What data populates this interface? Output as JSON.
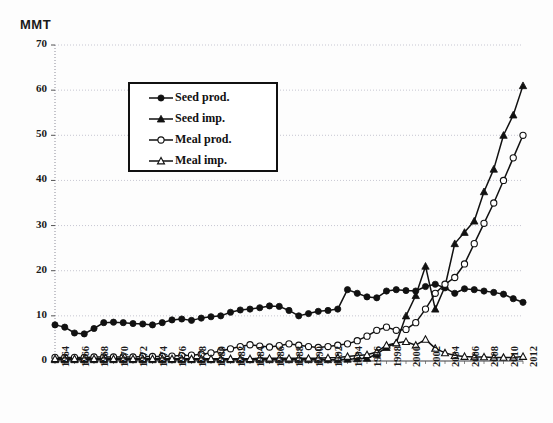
{
  "chart_data": {
    "type": "line",
    "title": "",
    "ylabel": "MMT",
    "xlabel": "",
    "ylim": [
      0,
      70
    ],
    "yticks": [
      0,
      10,
      20,
      30,
      40,
      50,
      60,
      70
    ],
    "grid": true,
    "legend_position": "upper-left-inside",
    "x": [
      1964,
      1965,
      1966,
      1967,
      1968,
      1969,
      1970,
      1971,
      1972,
      1973,
      1974,
      1975,
      1976,
      1977,
      1978,
      1979,
      1980,
      1981,
      1982,
      1983,
      1984,
      1985,
      1986,
      1987,
      1988,
      1989,
      1990,
      1991,
      1992,
      1993,
      1994,
      1995,
      1996,
      1997,
      1998,
      1999,
      2000,
      2001,
      2002,
      2003,
      2004,
      2005,
      2006,
      2007,
      2008,
      2009,
      2010,
      2011,
      2012
    ],
    "xtick_labels": [
      "1964",
      "1966",
      "1968",
      "1970",
      "1972",
      "1974",
      "1976",
      "1978",
      "1980",
      "1982",
      "1984",
      "1986",
      "1988",
      "1990",
      "1992",
      "1994",
      "1996",
      "1998",
      "2000",
      "2002",
      "2004",
      "2006",
      "2008",
      "2010",
      "2012"
    ],
    "series": [
      {
        "name": "Seed prod.",
        "marker": "filled-circle",
        "values": [
          8.0,
          7.5,
          6.2,
          6.0,
          7.2,
          8.5,
          8.6,
          8.5,
          8.3,
          8.2,
          8.0,
          8.5,
          9.1,
          9.3,
          9.0,
          9.5,
          9.8,
          10.0,
          10.8,
          11.3,
          11.5,
          11.8,
          12.2,
          12.1,
          11.2,
          10.0,
          10.5,
          11.0,
          11.2,
          11.5,
          15.8,
          15.0,
          14.2,
          14.0,
          15.5,
          15.8,
          15.6,
          15.5,
          16.5,
          17.0,
          16.2,
          15.0,
          16.0,
          15.8,
          15.5,
          15.2,
          14.8,
          13.8,
          13.0
        ]
      },
      {
        "name": "Seed imp.",
        "marker": "filled-triangle",
        "values": [
          0.3,
          0.3,
          0.3,
          0.3,
          0.3,
          0.3,
          0.3,
          0.3,
          0.3,
          0.3,
          0.3,
          0.3,
          0.3,
          0.3,
          0.3,
          0.3,
          0.3,
          0.3,
          0.3,
          0.3,
          0.3,
          0.3,
          0.3,
          0.3,
          0.3,
          0.3,
          0.3,
          0.3,
          0.3,
          0.3,
          0.4,
          0.5,
          0.6,
          1.5,
          3.0,
          4.0,
          10.0,
          14.5,
          21.0,
          11.5,
          16.5,
          26.0,
          28.5,
          31.0,
          37.5,
          42.5,
          50.0,
          54.5,
          61.0
        ]
      },
      {
        "name": "Meal prod.",
        "marker": "open-circle",
        "values": [
          0.8,
          0.8,
          0.8,
          0.8,
          0.9,
          0.9,
          0.9,
          0.9,
          0.9,
          1.0,
          1.0,
          1.0,
          1.1,
          1.2,
          1.3,
          1.5,
          1.8,
          2.2,
          2.7,
          3.2,
          3.6,
          3.3,
          3.1,
          3.4,
          3.8,
          3.5,
          3.2,
          3.0,
          3.2,
          3.5,
          3.8,
          4.5,
          5.5,
          6.8,
          7.5,
          6.8,
          7.0,
          8.5,
          11.5,
          15.0,
          17.0,
          18.5,
          21.5,
          26.0,
          30.5,
          35.0,
          40.0,
          45.0,
          50.0
        ]
      },
      {
        "name": "Meal imp.",
        "marker": "open-triangle",
        "values": [
          0.5,
          0.5,
          0.5,
          0.5,
          0.5,
          0.5,
          0.5,
          0.5,
          0.5,
          0.5,
          0.5,
          0.5,
          0.5,
          0.5,
          0.5,
          0.5,
          0.5,
          0.5,
          0.5,
          0.5,
          0.5,
          0.6,
          0.6,
          0.6,
          0.6,
          0.6,
          0.6,
          0.6,
          0.7,
          0.8,
          1.0,
          1.2,
          1.4,
          2.0,
          3.5,
          4.0,
          4.3,
          3.5,
          4.8,
          2.8,
          1.8,
          1.2,
          1.0,
          0.9,
          0.9,
          0.8,
          0.8,
          0.8,
          1.0
        ]
      }
    ]
  },
  "axes": {
    "y_axis_title": "MMT"
  },
  "colors": {
    "line": "#111111",
    "grid": "#b9b9c6",
    "axis": "#8c8c99",
    "legend_border": "#111111",
    "background": "#fdfdfd"
  }
}
